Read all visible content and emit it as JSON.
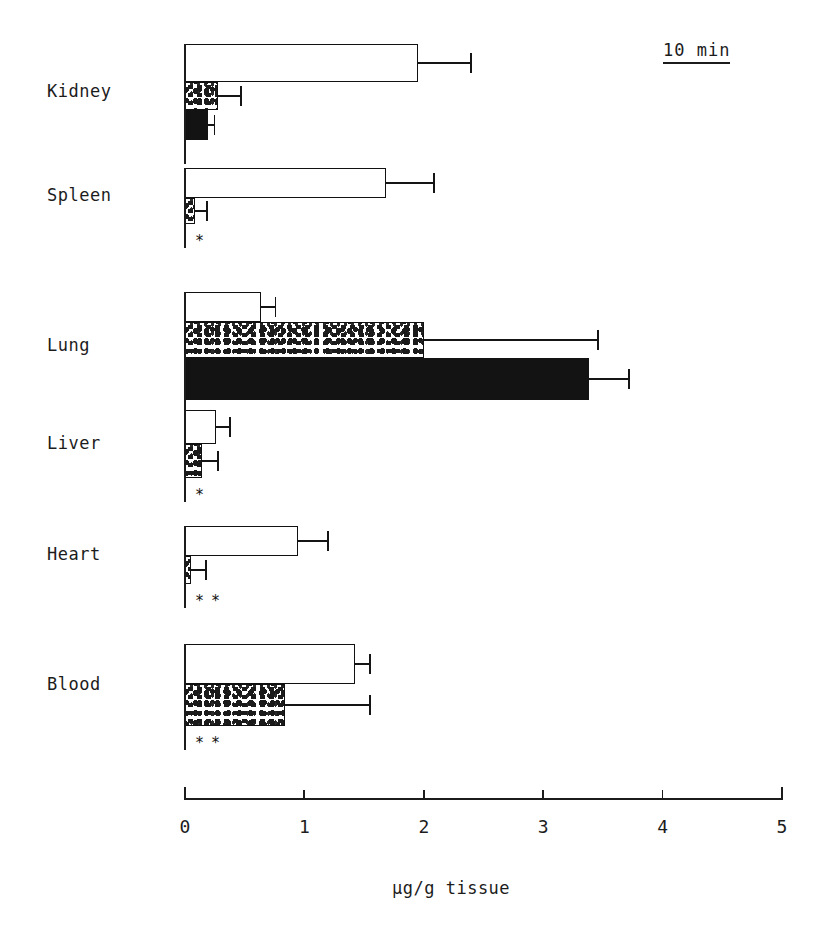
{
  "chart_data": {
    "type": "bar",
    "orientation": "horizontal",
    "title": "",
    "xlabel": "µg/g tissue",
    "ylabel": "",
    "xlim": [
      0,
      5
    ],
    "xticks": [
      0,
      1,
      2,
      3,
      4,
      5
    ],
    "xtick_labels": [
      "0",
      "1",
      "2",
      "3",
      "4",
      "5"
    ],
    "grid": false,
    "legend": "none",
    "annotation": "10 min",
    "categories": [
      "Kidney",
      "Spleen",
      "Lung",
      "Liver",
      "Heart",
      "Blood"
    ],
    "series": [
      {
        "name": "white",
        "fill": "open",
        "values": [
          1.95,
          1.68,
          0.64,
          0.26,
          0.95,
          1.42
        ],
        "errors": [
          0.44,
          0.4,
          0.11,
          0.11,
          0.24,
          0.12
        ]
      },
      {
        "name": "stippled",
        "fill": "stippled",
        "values": [
          0.28,
          0.08,
          2.0,
          0.14,
          0.05,
          0.84
        ],
        "errors": [
          0.18,
          0.1,
          1.45,
          0.13,
          0.12,
          0.7
        ]
      },
      {
        "name": "black",
        "fill": "solid",
        "values": [
          0.19,
          0.0,
          3.38,
          0.0,
          0.0,
          0.0
        ],
        "errors": [
          0.05,
          0.0,
          0.33,
          0.0,
          0.0,
          0.0
        ]
      }
    ],
    "significance_marks": [
      "",
      "*",
      "",
      "*",
      "**",
      "**"
    ]
  },
  "axis": {
    "tick_0": "0",
    "tick_1": "1",
    "tick_2": "2",
    "tick_3": "3",
    "tick_4": "4",
    "tick_5": "5",
    "title": "µg/g tissue"
  },
  "labels": {
    "kidney": "Kidney",
    "spleen": "Spleen",
    "lung": "Lung",
    "liver": "Liver",
    "heart": "Heart",
    "blood": "Blood"
  },
  "annotation": {
    "text": "10 min"
  },
  "significance": {
    "spleen": "*",
    "liver": "*",
    "heart": "* *",
    "blood": "* *"
  },
  "colors": {
    "ink": "#1c1c1c",
    "solid_fill": "#131313",
    "open_fill": "#ffffff",
    "background": "#ffffff"
  }
}
